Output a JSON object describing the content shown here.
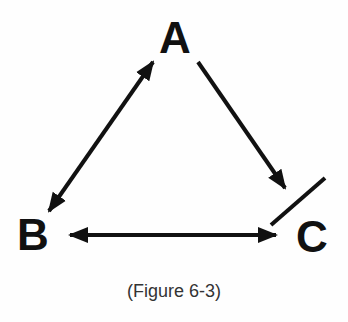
{
  "diagram": {
    "nodes": [
      {
        "id": "A",
        "label": "A"
      },
      {
        "id": "B",
        "label": "B"
      },
      {
        "id": "C",
        "label": "C"
      }
    ],
    "edges": [
      {
        "from": "A",
        "to": "B",
        "direction": "both"
      },
      {
        "from": "A",
        "to": "C",
        "direction": "forward"
      },
      {
        "from": "B",
        "to": "C",
        "direction": "both"
      }
    ],
    "annotations": [
      {
        "type": "slash",
        "near": "C"
      }
    ],
    "caption": "(Figure 6-3)"
  }
}
